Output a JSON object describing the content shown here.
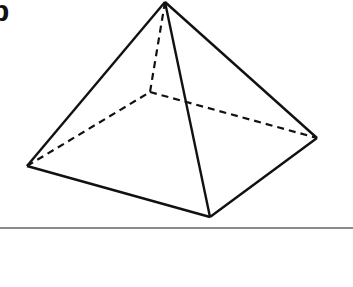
{
  "figure": {
    "label": "b",
    "stroke_color": "#111111",
    "rule_color": "#8a8a8a",
    "vertices": {
      "apex": [
        165,
        2
      ],
      "left": [
        27,
        166
      ],
      "front": [
        210,
        217
      ],
      "right": [
        317,
        138
      ],
      "back": [
        150,
        92
      ]
    },
    "solid_edges": [
      [
        "apex",
        "left"
      ],
      [
        "apex",
        "front"
      ],
      [
        "apex",
        "right"
      ],
      [
        "left",
        "front"
      ],
      [
        "front",
        "right"
      ]
    ],
    "hidden_edges": [
      [
        "apex",
        "back"
      ],
      [
        "left",
        "back"
      ],
      [
        "back",
        "right"
      ]
    ]
  }
}
